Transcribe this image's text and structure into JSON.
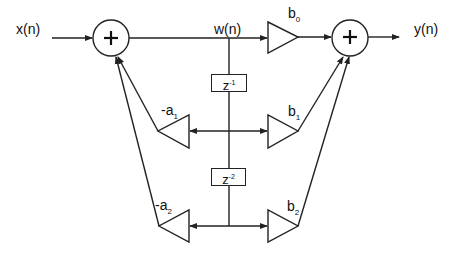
{
  "diagram": {
    "type": "direct-form-II biquad filter block diagram",
    "input": {
      "label": "x(n)"
    },
    "output": {
      "label": "y(n)"
    },
    "internal_signal": {
      "label": "w(n)"
    },
    "adders": [
      {
        "id": "left-adder",
        "symbol": "+"
      },
      {
        "id": "right-adder",
        "symbol": "+"
      }
    ],
    "delays": [
      {
        "base": "z",
        "exp": "-1"
      },
      {
        "base": "z",
        "exp": "-2"
      }
    ],
    "feedback_gains": [
      {
        "prefix": "-a",
        "sub": "1"
      },
      {
        "prefix": "-a",
        "sub": "2"
      }
    ],
    "feedforward_gains": [
      {
        "prefix": "b",
        "sub": "0"
      },
      {
        "prefix": "b",
        "sub": "1"
      },
      {
        "prefix": "b",
        "sub": "2"
      }
    ],
    "colors": {
      "stroke": "#222222",
      "background": "#ffffff"
    }
  }
}
